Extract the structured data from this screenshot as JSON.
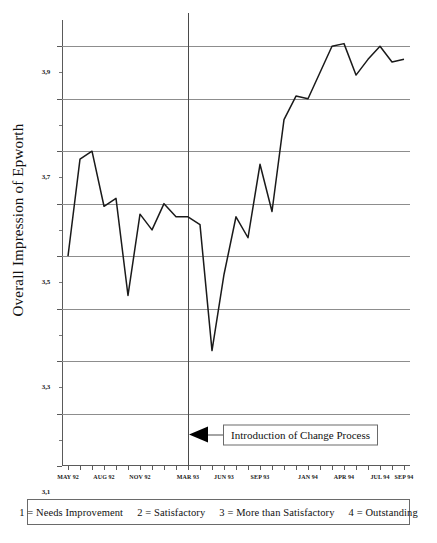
{
  "chart_data": {
    "type": "line",
    "title": "",
    "xlabel": "",
    "ylabel": "Overall Impression of Epworth",
    "ylim": [
      2.3,
      4.0
    ],
    "yticks": [
      "2,3",
      "2,5",
      "2,7",
      "2,9",
      "3,1",
      "3,3",
      "3,5",
      "3,7",
      "3,9"
    ],
    "ytick_values": [
      2.3,
      2.5,
      2.7,
      2.9,
      3.1,
      3.3,
      3.5,
      3.7,
      3.9
    ],
    "grid": true,
    "legend_position": "none",
    "x": [
      "MAY 92",
      "JUN 92",
      "JUL 92",
      "AUG 92",
      "SEP 92",
      "OCT 92",
      "NOV 92",
      "DEC 92",
      "JAN 93",
      "FEB 93",
      "MAR 93",
      "APR 93",
      "MAY 93",
      "JUN 93",
      "JUL 93",
      "AUG 93",
      "SEP 93",
      "OCT 93",
      "NOV 93",
      "DEC 93",
      "JAN 94",
      "FEB 94",
      "MAR 94",
      "APR 94",
      "MAY 94",
      "JUN 94",
      "JUL 94",
      "AUG 94",
      "SEP 94"
    ],
    "xtick_labels": [
      "MAY 92",
      "AUG 92",
      "NOV 92",
      "MAR 93",
      "JUN 93",
      "SEP 93",
      "JAN 94",
      "APR 94",
      "JUL 94",
      "SEP 94"
    ],
    "xtick_label_indices": [
      0,
      3,
      6,
      10,
      13,
      16,
      20,
      23,
      26,
      28
    ],
    "values": [
      3.1,
      3.47,
      3.5,
      3.29,
      3.32,
      2.95,
      3.26,
      3.2,
      3.3,
      3.25,
      3.25,
      3.22,
      2.74,
      3.03,
      3.25,
      3.17,
      3.45,
      3.27,
      3.62,
      3.71,
      3.7,
      3.8,
      3.9,
      3.91,
      3.79,
      3.85,
      3.9,
      3.84,
      3.85
    ],
    "series": [
      {
        "name": "Overall Impression of Epworth",
        "color": "#1a1a1a",
        "values": [
          3.1,
          3.47,
          3.5,
          3.29,
          3.32,
          2.95,
          3.26,
          3.2,
          3.3,
          3.25,
          3.25,
          3.22,
          2.74,
          3.03,
          3.25,
          3.17,
          3.45,
          3.27,
          3.62,
          3.71,
          3.7,
          3.8,
          3.9,
          3.91,
          3.79,
          3.85,
          3.9,
          3.84,
          3.85
        ]
      }
    ],
    "annotations": [
      {
        "text": "Introduction of Change Process",
        "at_x": "MAR 93",
        "at_x_index": 10,
        "at_y": 2.42
      }
    ]
  },
  "footer": {
    "entries": [
      "1 = Needs Improvement",
      "2 = Satisfactory",
      "3 = More than Satisfactory",
      "4 = Outstanding"
    ]
  },
  "colors": {
    "line": "#1a1a1a",
    "grid": "#8d8d8d",
    "axis": "#5a5a5a",
    "event_line": "#4a4a4a",
    "background": "#ffffff"
  }
}
